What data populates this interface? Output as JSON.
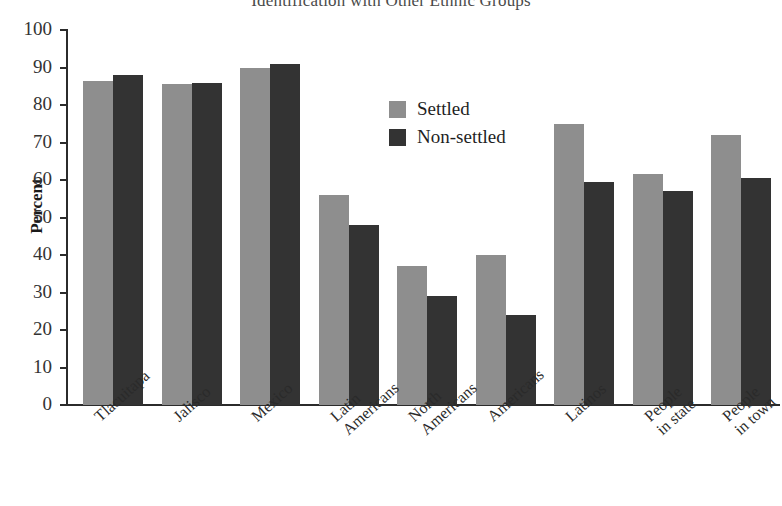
{
  "chart_data": {
    "type": "bar",
    "title": "Identification with Other Ethnic Groups",
    "xlabel": "",
    "ylabel": "Percent",
    "ylim": [
      0,
      100
    ],
    "y_ticks": [
      0,
      10,
      20,
      30,
      40,
      50,
      60,
      70,
      80,
      90,
      100
    ],
    "grid": false,
    "legend_position": "inside-upper-center",
    "categories": [
      "Tlacuitapa",
      "Jalisco",
      "Mexico",
      "Latin Americans",
      "North Americans",
      "Americans",
      "Latinos",
      "People in state",
      "People in town"
    ],
    "category_lines": [
      [
        "Tlacuitapa",
        ""
      ],
      [
        "Jalisco",
        ""
      ],
      [
        "Mexico",
        ""
      ],
      [
        "Latin",
        "Americans"
      ],
      [
        "North",
        "Americans"
      ],
      [
        "Americans",
        ""
      ],
      [
        "Latinos",
        ""
      ],
      [
        "People",
        "in state"
      ],
      [
        "People",
        "in town"
      ]
    ],
    "series": [
      {
        "name": "Settled",
        "color": "#8e8e8e",
        "values": [
          86.5,
          85.5,
          90.0,
          56.0,
          37.0,
          40.0,
          75.0,
          61.5,
          72.0
        ]
      },
      {
        "name": "Non-settled",
        "color": "#333333",
        "values": [
          88.0,
          86.0,
          91.0,
          48.0,
          29.0,
          24.0,
          59.5,
          57.0,
          60.5
        ]
      }
    ]
  },
  "legend": {
    "items": [
      {
        "label": "Settled"
      },
      {
        "label": "Non-settled"
      }
    ]
  },
  "axis": {
    "y_title": "Percent"
  }
}
